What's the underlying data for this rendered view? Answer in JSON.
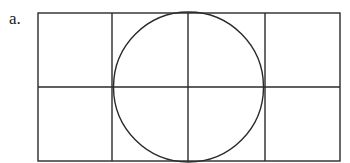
{
  "figure": {
    "label": "a.",
    "grid": {
      "columns": 4,
      "rows": 2
    },
    "shapes": [
      "rectangle-grid",
      "circle"
    ],
    "stroke_color": "#2a2a2a"
  }
}
